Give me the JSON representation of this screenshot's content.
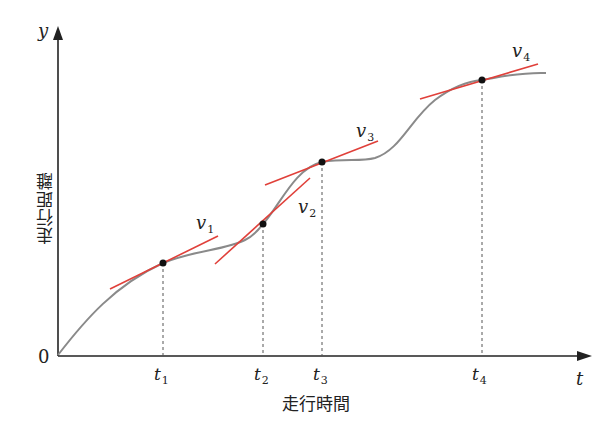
{
  "figure": {
    "y_axis": {
      "symbol": "y",
      "label": "走行距離"
    },
    "x_axis": {
      "symbol": "t",
      "label": "走行時間"
    },
    "origin_label": "0",
    "time_ticks": [
      {
        "base": "t",
        "sub": "1"
      },
      {
        "base": "t",
        "sub": "2"
      },
      {
        "base": "t",
        "sub": "3"
      },
      {
        "base": "t",
        "sub": "4"
      }
    ],
    "velocity_labels": [
      {
        "base": "v",
        "sub": "1"
      },
      {
        "base": "v",
        "sub": "2"
      },
      {
        "base": "v",
        "sub": "3"
      },
      {
        "base": "v",
        "sub": "4"
      }
    ],
    "colors": {
      "axis": "#222222",
      "curve": "#8a8a8a",
      "tangent": "#e0403a",
      "point": "#111111",
      "guide": "#555555"
    }
  }
}
